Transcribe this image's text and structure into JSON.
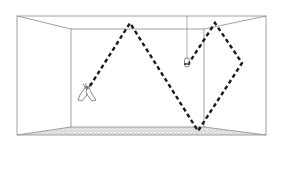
{
  "diagram": {
    "type": "room-acoustics-reflection-path",
    "room": {
      "outer": {
        "x1": 17,
        "y1": 16,
        "x2": 266,
        "y2": 135
      },
      "back_wall": {
        "x1": 71,
        "y1": 29,
        "x2": 204,
        "y2": 127
      },
      "line_color": "#8a8a8a",
      "floor_texture_color": "#bdbdbd"
    },
    "source": {
      "name": "clapping-hands",
      "x": 88,
      "y": 88
    },
    "receiver": {
      "name": "hanging-microphone",
      "x": 187,
      "y": 63,
      "cable_top_y": 16
    },
    "reflection_path": {
      "points": [
        [
          90,
          86
        ],
        [
          130,
          23
        ],
        [
          198,
          131
        ],
        [
          242,
          63
        ],
        [
          215,
          23
        ],
        [
          189,
          63
        ]
      ],
      "color": "#1a1a1a",
      "dash": "4 3",
      "width": 2.4
    }
  }
}
